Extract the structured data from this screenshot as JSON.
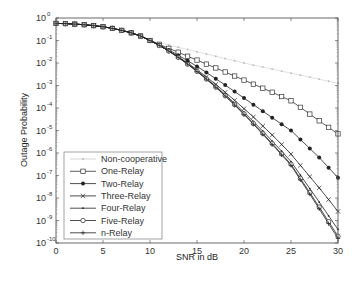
{
  "chart_data": {
    "type": "line",
    "title": "",
    "xlabel": "SNR in dB",
    "ylabel": "Outage Probability",
    "xlim": [
      0,
      30
    ],
    "ylim": [
      1e-10,
      1
    ],
    "yscale": "log",
    "x_ticks": [
      "0",
      "5",
      "10",
      "15",
      "20",
      "25",
      "30"
    ],
    "y_ticks": [
      "10^0",
      "10^-1",
      "10^-2",
      "10^-3",
      "10^-4",
      "10^-5",
      "10^-6",
      "10^-7",
      "10^-8",
      "10^-9",
      "10^-10"
    ],
    "grid": false,
    "legend_position": "lower left",
    "x": [
      0,
      1,
      2,
      3,
      4,
      5,
      6,
      7,
      8,
      9,
      10,
      11,
      12,
      13,
      14,
      15,
      16,
      17,
      18,
      19,
      20,
      21,
      22,
      23,
      24,
      25,
      26,
      27,
      28,
      29,
      30
    ],
    "series": [
      {
        "name": "Non-cooperative",
        "marker": "dot",
        "color": "#cccccc",
        "log10_values": [
          -0.24,
          -0.25,
          -0.27,
          -0.3,
          -0.34,
          -0.39,
          -0.46,
          -0.55,
          -0.66,
          -0.8,
          -1.0,
          -1.1,
          -1.2,
          -1.3,
          -1.4,
          -1.5,
          -1.6,
          -1.7,
          -1.8,
          -1.9,
          -2.0,
          -2.09,
          -2.18,
          -2.27,
          -2.36,
          -2.45,
          -2.54,
          -2.63,
          -2.72,
          -2.81,
          -2.9
        ]
      },
      {
        "name": "One-Relay",
        "marker": "square",
        "color": "#333333",
        "log10_values": [
          -0.24,
          -0.25,
          -0.27,
          -0.3,
          -0.34,
          -0.39,
          -0.46,
          -0.55,
          -0.66,
          -0.8,
          -1.0,
          -1.17,
          -1.35,
          -1.52,
          -1.7,
          -1.87,
          -2.05,
          -2.22,
          -2.4,
          -2.58,
          -2.76,
          -2.94,
          -3.12,
          -3.3,
          -3.49,
          -3.68,
          -3.97,
          -4.27,
          -4.57,
          -4.86,
          -5.15
        ]
      },
      {
        "name": "Two-Relay",
        "marker": "filled-circle",
        "color": "#222222",
        "log10_values": [
          -0.24,
          -0.25,
          -0.27,
          -0.3,
          -0.34,
          -0.39,
          -0.46,
          -0.55,
          -0.66,
          -0.8,
          -1.0,
          -1.2,
          -1.42,
          -1.65,
          -1.9,
          -2.15,
          -2.42,
          -2.7,
          -2.98,
          -3.27,
          -3.56,
          -3.85,
          -4.14,
          -4.43,
          -4.72,
          -5.0,
          -5.4,
          -5.8,
          -6.2,
          -6.65,
          -7.1
        ]
      },
      {
        "name": "Three-Relay",
        "marker": "x",
        "color": "#222222",
        "log10_values": [
          -0.24,
          -0.25,
          -0.27,
          -0.3,
          -0.34,
          -0.39,
          -0.46,
          -0.55,
          -0.66,
          -0.8,
          -1.0,
          -1.22,
          -1.46,
          -1.72,
          -2.0,
          -2.3,
          -2.62,
          -2.95,
          -3.3,
          -3.66,
          -4.03,
          -4.4,
          -4.8,
          -5.2,
          -5.62,
          -6.05,
          -6.55,
          -7.05,
          -7.55,
          -8.07,
          -8.6
        ]
      },
      {
        "name": "Four-Relay",
        "marker": "dot",
        "color": "#222222",
        "log10_values": [
          -0.24,
          -0.25,
          -0.27,
          -0.3,
          -0.34,
          -0.39,
          -0.46,
          -0.55,
          -0.66,
          -0.8,
          -1.0,
          -1.22,
          -1.47,
          -1.74,
          -2.03,
          -2.35,
          -2.68,
          -3.03,
          -3.4,
          -3.79,
          -4.19,
          -4.6,
          -5.03,
          -5.47,
          -5.92,
          -6.38,
          -6.98,
          -7.58,
          -8.18,
          -8.79,
          -9.4
        ]
      },
      {
        "name": "Five-Relay",
        "marker": "circle",
        "color": "#222222",
        "log10_values": [
          -0.24,
          -0.25,
          -0.27,
          -0.3,
          -0.34,
          -0.39,
          -0.46,
          -0.55,
          -0.66,
          -0.8,
          -1.0,
          -1.22,
          -1.47,
          -1.75,
          -2.05,
          -2.37,
          -2.71,
          -3.07,
          -3.45,
          -3.85,
          -4.26,
          -4.69,
          -5.13,
          -5.58,
          -6.04,
          -6.5,
          -7.13,
          -7.76,
          -8.4,
          -9.05,
          -9.7
        ]
      },
      {
        "name": "n-Relay",
        "marker": "plus",
        "color": "#222222",
        "log10_values": [
          -0.24,
          -0.25,
          -0.27,
          -0.3,
          -0.34,
          -0.39,
          -0.46,
          -0.55,
          -0.66,
          -0.8,
          -1.0,
          -1.22,
          -1.47,
          -1.75,
          -2.05,
          -2.38,
          -2.72,
          -3.08,
          -3.47,
          -3.87,
          -4.29,
          -4.72,
          -5.17,
          -5.62,
          -6.08,
          -6.55,
          -7.19,
          -7.83,
          -8.48,
          -9.14,
          -9.8
        ]
      }
    ]
  },
  "axes": {
    "xlabel": "SNR in dB",
    "ylabel": "Outage Probability"
  },
  "legend": {
    "items": [
      "Non-cooperative",
      "One-Relay",
      "Two-Relay",
      "Three-Relay",
      "Four-Relay",
      "Five-Relay",
      "n-Relay"
    ]
  }
}
